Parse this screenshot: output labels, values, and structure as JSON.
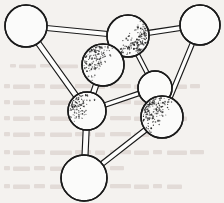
{
  "figure": {
    "title": "Ball-and-stick structural model",
    "type": "molecular-structure-diagram",
    "style": "line-art-stipple-shading",
    "canvas": {
      "width": 224,
      "height": 203
    },
    "colors": {
      "background": "#f4f2ef",
      "outline": "#1a1a1a",
      "sphere_fill": "#fbfbfa",
      "stipple": "#2b2b2b",
      "bond_fill": "#fdfdfc",
      "bleed_text": "#cfc3c0"
    },
    "atoms": [
      {
        "id": "A1",
        "label": "top-left",
        "cx": 26,
        "cy": 26,
        "r": 21,
        "shaded": false,
        "shade_angle": 0
      },
      {
        "id": "A2",
        "label": "top-middle",
        "cx": 128,
        "cy": 36,
        "r": 21,
        "shaded": true,
        "shade_angle": 35
      },
      {
        "id": "A3",
        "label": "top-right",
        "cx": 200,
        "cy": 25,
        "r": 20,
        "shaded": false,
        "shade_angle": 0
      },
      {
        "id": "A4",
        "label": "middle-left",
        "cx": 103,
        "cy": 65,
        "r": 21,
        "shaded": true,
        "shade_angle": 215
      },
      {
        "id": "A5",
        "label": "lower-left",
        "cx": 87,
        "cy": 111,
        "r": 19,
        "shaded": true,
        "shade_angle": 215
      },
      {
        "id": "A6",
        "label": "center-right-small",
        "cx": 155,
        "cy": 88,
        "r": 17,
        "shaded": false,
        "shade_angle": 0
      },
      {
        "id": "A7",
        "label": "lower-right",
        "cx": 162,
        "cy": 117,
        "r": 21,
        "shaded": true,
        "shade_angle": 215
      },
      {
        "id": "A8",
        "label": "bottom",
        "cx": 84,
        "cy": 178,
        "r": 23,
        "shaded": false,
        "shade_angle": 0
      }
    ],
    "bonds": [
      {
        "from": "A1",
        "to": "A2",
        "width": 5.0
      },
      {
        "from": "A1",
        "to": "A5",
        "width": 5.5
      },
      {
        "from": "A2",
        "to": "A3",
        "width": 5.0
      },
      {
        "from": "A2",
        "to": "A6",
        "width": 4.0
      },
      {
        "from": "A3",
        "to": "A7",
        "width": 4.5
      },
      {
        "from": "A4",
        "to": "A5",
        "width": 5.5
      },
      {
        "from": "A6",
        "to": "A5",
        "width": 4.5
      },
      {
        "from": "A5",
        "to": "A8",
        "width": 6.0
      },
      {
        "from": "A8",
        "to": "A7",
        "width": 5.0
      },
      {
        "from": "A2",
        "to": "A4",
        "width": 4.0
      }
    ],
    "bleed_through_lines": [
      {
        "x": 4,
        "y": 84,
        "w": 196,
        "h": 6
      },
      {
        "x": 4,
        "y": 100,
        "w": 160,
        "h": 6
      },
      {
        "x": 4,
        "y": 116,
        "w": 184,
        "h": 6
      },
      {
        "x": 4,
        "y": 132,
        "w": 150,
        "h": 6
      },
      {
        "x": 4,
        "y": 150,
        "w": 200,
        "h": 6
      },
      {
        "x": 4,
        "y": 166,
        "w": 120,
        "h": 6
      },
      {
        "x": 4,
        "y": 184,
        "w": 178,
        "h": 6
      },
      {
        "x": 10,
        "y": 64,
        "w": 90,
        "h": 5
      }
    ]
  }
}
